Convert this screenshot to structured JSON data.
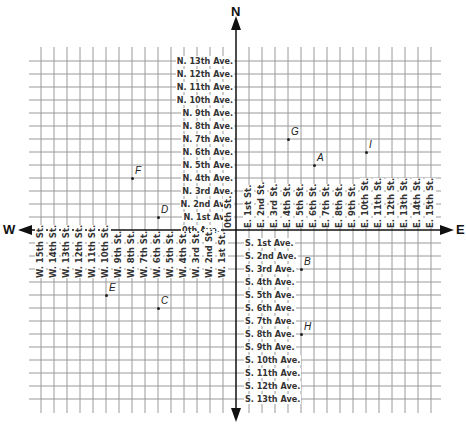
{
  "title": "",
  "compass": {
    "north": "N",
    "south": "",
    "east": "E",
    "west": "W"
  },
  "grid": {
    "origin": {
      "x": 236,
      "y": 230
    },
    "cell": 13.0,
    "x_lines_west": 15,
    "x_lines_east": 15,
    "y_lines_north": 13,
    "y_lines_south": 13,
    "line_color": "#9a9a9a",
    "axis_color": "#111111"
  },
  "avenues": {
    "zero": "0th Ave.",
    "north": [
      "N. 1st Ave.",
      "N. 2nd Ave.",
      "N. 3rd Ave.",
      "N. 4th Ave.",
      "N. 5th Ave.",
      "N. 6th Ave.",
      "N. 7th Ave.",
      "N. 8th Ave.",
      "N. 9th Ave.",
      "N. 10th Ave.",
      "N. 11th Ave.",
      "N. 12th Ave.",
      "N. 13th Ave."
    ],
    "south": [
      "S. 1st Ave.",
      "S. 2nd Ave.",
      "S. 3rd Ave.",
      "S. 4th Ave.",
      "S. 5th Ave.",
      "S. 6th Ave.",
      "S. 7th Ave.",
      "S. 8th Ave.",
      "S. 9th Ave.",
      "S. 10th Ave.",
      "S. 11th Ave.",
      "S. 12th Ave.",
      "S. 13th Ave."
    ]
  },
  "streets": {
    "zero": "0th St.",
    "east": [
      "E. 1st St.",
      "E. 2nd St.",
      "E. 3rd St.",
      "E. 4th St.",
      "E. 5th St.",
      "E. 6th St.",
      "E. 7th St.",
      "E. 8th St.",
      "E. 9th St.",
      "E. 10th St.",
      "E. 11th St.",
      "E. 12th St.",
      "E. 13th St.",
      "E. 14th St.",
      "E. 15th St."
    ],
    "west": [
      "W. 1st St.",
      "W. 2nd St.",
      "W. 3rd St.",
      "W. 4th St.",
      "W. 5th St.",
      "W. 6th St.",
      "W. 7th St.",
      "W. 8th St.",
      "W. 9th St.",
      "W. 10th St.",
      "W. 11th St.",
      "W. 12th St.",
      "W. 13th St.",
      "W. 14th St.",
      "W. 15th St."
    ]
  },
  "points": [
    {
      "label": "A",
      "street": 6,
      "avenue": 5
    },
    {
      "label": "B",
      "street": 5,
      "avenue": -3
    },
    {
      "label": "C",
      "street": -6,
      "avenue": -6
    },
    {
      "label": "D",
      "street": -6,
      "avenue": 1
    },
    {
      "label": "E",
      "street": -10,
      "avenue": -5
    },
    {
      "label": "F",
      "street": -8,
      "avenue": 4
    },
    {
      "label": "G",
      "street": 4,
      "avenue": 7
    },
    {
      "label": "H",
      "street": 5,
      "avenue": -8
    },
    {
      "label": "I",
      "street": 10,
      "avenue": 6
    }
  ]
}
